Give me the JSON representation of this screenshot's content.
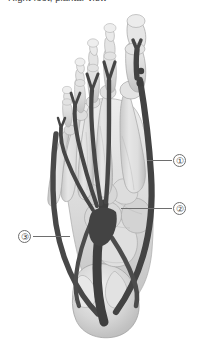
{
  "figure": {
    "caption": "Right foot, plantar view",
    "width": 200,
    "height": 342,
    "background_color": "#ffffff",
    "view": "plantar"
  },
  "colors": {
    "background": "#ffffff",
    "bone_light": "#e4e4e4",
    "bone_mid": "#cfcfcf",
    "bone_shadow": "#b0b0b0",
    "bone_outline": "#9a9a9a",
    "tendon_dark": "#4a4a4a",
    "tendon_darker": "#3a3a3a",
    "tendon_highlight": "#6a6a6a",
    "leader_line": "#6e6e6e",
    "callout_text": "#3c3c3c",
    "caption_text": "#3a3a3a"
  },
  "callouts": [
    {
      "id": "1",
      "label": "①",
      "number": "1",
      "x": 173,
      "y": 154,
      "leader": {
        "x": 147,
        "y": 160,
        "length": 25,
        "direction": "left"
      }
    },
    {
      "id": "2",
      "label": "②",
      "number": "2",
      "x": 173,
      "y": 202,
      "leader": {
        "x": 121,
        "y": 208,
        "length": 51,
        "direction": "left"
      }
    },
    {
      "id": "3",
      "label": "③",
      "number": "3",
      "x": 18,
      "y": 230,
      "leader": {
        "x": 33,
        "y": 236,
        "length": 37,
        "direction": "right"
      }
    }
  ],
  "illustration": {
    "type": "anatomical-line-art",
    "structures": [
      "phalanges",
      "metatarsals",
      "cuneiforms",
      "navicular",
      "cuboid",
      "talus",
      "calcaneus",
      "flexor-tendons",
      "tendon-insertions"
    ],
    "toe_count": 5
  }
}
